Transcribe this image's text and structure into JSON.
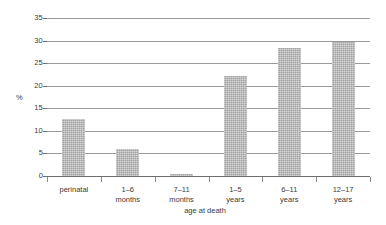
{
  "chart_data": {
    "type": "bar",
    "title": "",
    "subtitle": "",
    "xlabel": "age at death",
    "ylabel": "%",
    "categories": [
      "perinatal",
      "1–6 months",
      "7–11 months",
      "1–5 years",
      "6–11 years",
      "12–17 years"
    ],
    "category_lines": [
      [
        "perinatal"
      ],
      [
        "1–6",
        "months"
      ],
      [
        "7–11",
        "months"
      ],
      [
        "1–5",
        "years"
      ],
      [
        "6–11",
        "years"
      ],
      [
        "12–17",
        "years"
      ]
    ],
    "values": [
      12.7,
      6.0,
      0.4,
      22.2,
      28.4,
      29.6
    ],
    "ylim": [
      0,
      35
    ],
    "ytick_labels": [
      "0",
      "5",
      "10",
      "15",
      "20",
      "25",
      "30",
      "35"
    ],
    "ytick_values": [
      0,
      5,
      10,
      15,
      20,
      25,
      30,
      35
    ],
    "grid": true,
    "legend": "none",
    "bar_color": "#a3a3a3",
    "grid_color": "#9a9a9a",
    "axis_color": "#6e6e6e",
    "text_color": "#3a3a3a"
  }
}
